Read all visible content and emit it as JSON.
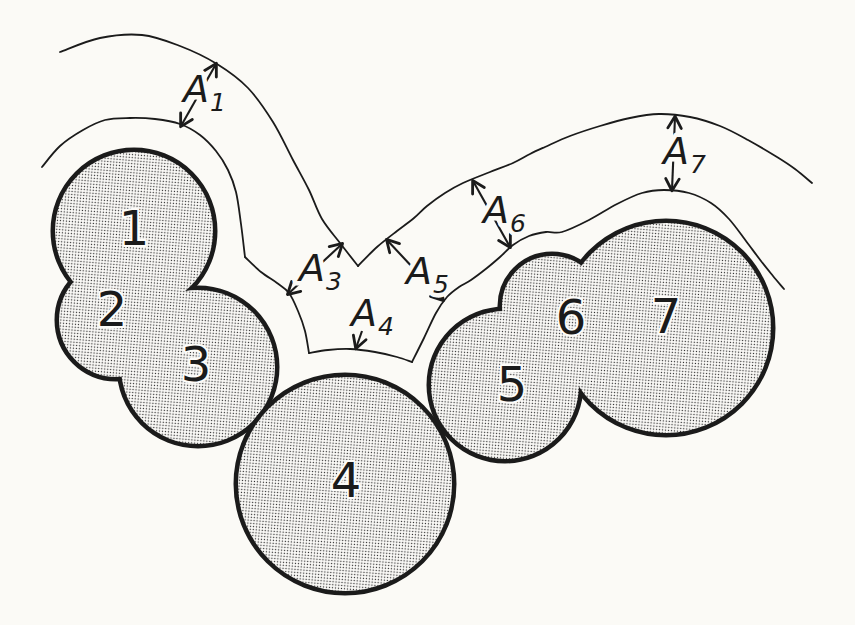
{
  "figure": {
    "colors": {
      "paper": "#fbfaf6",
      "ink": "#1b1b1b",
      "stipple_dot": "#2b2b2b",
      "stipple_bg": "#fdfcf9"
    },
    "blob_numbers": [
      {
        "n": "1",
        "x": 134,
        "y": 245
      },
      {
        "n": "2",
        "x": 112,
        "y": 326
      },
      {
        "n": "3",
        "x": 196,
        "y": 381
      },
      {
        "n": "4",
        "x": 346,
        "y": 497
      },
      {
        "n": "5",
        "x": 512,
        "y": 401
      },
      {
        "n": "6",
        "x": 571,
        "y": 334
      },
      {
        "n": "7",
        "x": 666,
        "y": 333
      }
    ],
    "clusters": [
      {
        "name": "blob-cluster-1-2-3",
        "circles": [
          [
            134,
            231,
            79
          ],
          [
            116,
            320,
            57
          ],
          [
            198,
            367,
            77
          ]
        ]
      },
      {
        "name": "blob-4",
        "circles": [
          [
            345,
            484,
            107
          ]
        ]
      },
      {
        "name": "blob-cluster-5-6-7",
        "circles": [
          [
            505,
            385,
            74
          ],
          [
            552,
            306,
            50
          ],
          [
            666,
            328,
            105
          ]
        ]
      }
    ],
    "contours": {
      "inner": [
        [
          [
            42,
            167
          ],
          [
            60,
            146
          ],
          [
            83,
            130
          ],
          [
            105,
            120
          ],
          [
            130,
            118
          ],
          [
            155,
            119
          ],
          [
            180,
            124
          ],
          [
            200,
            135
          ],
          [
            216,
            151
          ],
          [
            228,
            170
          ],
          [
            236,
            192
          ],
          [
            241,
            224
          ],
          [
            245,
            257
          ]
        ],
        [
          [
            245,
            257
          ],
          [
            261,
            272
          ],
          [
            277,
            283
          ],
          [
            289,
            293
          ],
          [
            298,
            311
          ],
          [
            305,
            331
          ],
          [
            309,
            353
          ]
        ],
        [
          [
            309,
            353
          ],
          [
            328,
            350
          ],
          [
            350,
            349
          ],
          [
            375,
            352
          ],
          [
            397,
            357
          ],
          [
            412,
            362
          ]
        ],
        [
          [
            412,
            362
          ],
          [
            424,
            338
          ],
          [
            436,
            313
          ],
          [
            447,
            297
          ],
          [
            459,
            287
          ],
          [
            471,
            280
          ],
          [
            487,
            268
          ],
          [
            500,
            257
          ],
          [
            513,
            245
          ],
          [
            529,
            236
          ],
          [
            546,
            232
          ],
          [
            562,
            232
          ],
          [
            589,
            220
          ],
          [
            617,
            204
          ],
          [
            642,
            193
          ],
          [
            664,
            190
          ],
          [
            689,
            193
          ],
          [
            711,
            203
          ],
          [
            729,
            219
          ],
          [
            746,
            241
          ],
          [
            761,
            261
          ],
          [
            773,
            276
          ],
          [
            784,
            289
          ]
        ]
      ],
      "outer": [
        [
          [
            60,
            52
          ],
          [
            100,
            38
          ],
          [
            142,
            35
          ],
          [
            180,
            46
          ],
          [
            217,
            64
          ],
          [
            248,
            88
          ],
          [
            273,
            122
          ],
          [
            293,
            160
          ],
          [
            309,
            190
          ],
          [
            322,
            219
          ],
          [
            340,
            243
          ],
          [
            358,
            266
          ]
        ],
        [
          [
            358,
            266
          ],
          [
            377,
            247
          ],
          [
            397,
            231
          ],
          [
            414,
            218
          ],
          [
            427,
            206
          ],
          [
            445,
            193
          ],
          [
            463,
            183
          ],
          [
            490,
            172
          ],
          [
            513,
            163
          ],
          [
            530,
            154
          ],
          [
            545,
            147
          ],
          [
            570,
            136
          ],
          [
            600,
            126
          ],
          [
            630,
            118
          ],
          [
            659,
            114
          ],
          [
            690,
            117
          ],
          [
            720,
            126
          ],
          [
            748,
            140
          ],
          [
            777,
            157
          ],
          [
            795,
            169
          ],
          [
            812,
            183
          ]
        ]
      ]
    },
    "annotations": [
      {
        "id": "A1",
        "base": "A",
        "sub": "1",
        "tx": 183,
        "ty": 102,
        "arrow": [
          181,
          126,
          216,
          64
        ],
        "heads": "both"
      },
      {
        "id": "A3",
        "base": "A",
        "sub": "3",
        "tx": 299,
        "ty": 281,
        "arrow": [
          288,
          294,
          342,
          244
        ],
        "heads": "both"
      },
      {
        "id": "A4",
        "base": "A",
        "sub": "4",
        "tx": 351,
        "ty": 326,
        "arrow": [
          362,
          331,
          356,
          348
        ],
        "heads": "end"
      },
      {
        "id": "A5",
        "base": "A",
        "sub": "5",
        "tx": 406,
        "ty": 284,
        "arrow": [
          443,
          300,
          387,
          240
        ],
        "heads": "both"
      },
      {
        "id": "A6",
        "base": "A",
        "sub": "6",
        "tx": 483,
        "ty": 223,
        "arrow": [
          510,
          247,
          473,
          181
        ],
        "heads": "both"
      },
      {
        "id": "A7",
        "base": "A",
        "sub": "7",
        "tx": 663,
        "ty": 164,
        "arrow": [
          672,
          190,
          675,
          117
        ],
        "heads": "both"
      }
    ]
  }
}
